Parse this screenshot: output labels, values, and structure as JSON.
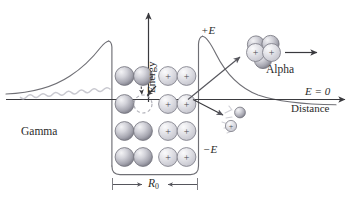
{
  "figure": {
    "title_semantic": "nuclear-potential-barrier-decay-diagram",
    "axes": {
      "y_label": "Energy",
      "x_label": "Distance",
      "zero_level_label": "E = 0",
      "positive_energy_label": "+E",
      "negative_energy_label": "−E"
    },
    "annotations": {
      "gamma_label": "Gamma",
      "alpha_label": "Alpha",
      "radius_label_main": "R",
      "radius_label_sub": "0"
    },
    "nucleon_symbols": {
      "proton": "+",
      "neutron": ""
    },
    "colors": {
      "line": "#6f6f75",
      "axis": "#3a3a3e",
      "text": "#2b2b2b",
      "neutron_light": "#e9e9ec",
      "neutron_mid": "#b9b9c0",
      "neutron_dark": "#7e7e88",
      "proton_light": "#f2f2f4",
      "proton_mid": "#cfcfd6",
      "proton_edge": "#85858f",
      "gamma": "#c9c9d0",
      "vacancy_dash": "#b0b0b8"
    },
    "nucleus": {
      "neutron_rows": 4,
      "neutron_cols": 2,
      "neutron_count": 7,
      "vacancy_count": 1,
      "proton_rows": 4,
      "proton_cols": 2,
      "proton_count": 8
    },
    "alpha_particle": {
      "proton_count": 2,
      "neutron_count": 2
    },
    "emitted_particles": {
      "neutral_count": 1,
      "charged_count": 1,
      "charged_symbol": "+"
    }
  }
}
